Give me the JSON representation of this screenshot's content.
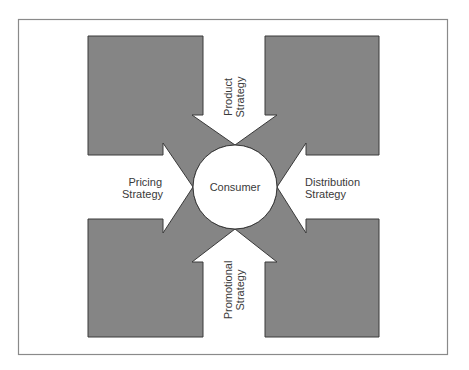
{
  "diagram": {
    "center": {
      "label": "Consumer"
    },
    "arrows": {
      "top": {
        "line1": "Product",
        "line2": "Strategy"
      },
      "left": {
        "line1": "Pricing",
        "line2": "Strategy"
      },
      "right": {
        "line1": "Distribution",
        "line2": "Strategy"
      },
      "bottom": {
        "line1": "Promotional",
        "line2": "Strategy"
      }
    },
    "colors": {
      "block_fill": "#858585",
      "outline": "#3a3a3a",
      "frame": "#8a8a8a",
      "background": "#ffffff"
    }
  }
}
